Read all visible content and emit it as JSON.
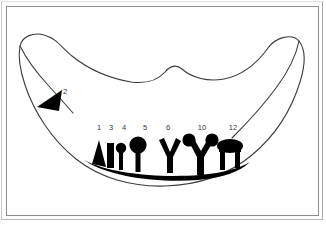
{
  "figure": {
    "background_color": "#ffffff",
    "outline_color": "#3c3c3c",
    "glyph_color": "#000000",
    "label_color": "#3a3a3a",
    "frame_color": "#8d8d8d"
  },
  "labels": {
    "pointer": {
      "text": "2",
      "x": 65,
      "y": 94
    },
    "items": [
      {
        "text": "1",
        "x": 99,
        "y": 130,
        "glyph": "triangle"
      },
      {
        "text": "3",
        "x": 110,
        "y": 130,
        "glyph": "bar"
      },
      {
        "text": "4",
        "x": 121,
        "y": 130,
        "glyph": "small-round-pin"
      },
      {
        "text": "5",
        "x": 138,
        "y": 130,
        "glyph": "large-round-pin"
      },
      {
        "text": "6",
        "x": 168,
        "y": 130,
        "glyph": "y-fork"
      },
      {
        "text": "10",
        "x": 200,
        "y": 130,
        "glyph": "y-fork-knobbed"
      },
      {
        "text": "12",
        "x": 230,
        "y": 130,
        "glyph": "mushroom-table"
      }
    ]
  },
  "shapes": {
    "outline_name": "wavy-closed-outline",
    "baseline_name": "thick-baseline-band",
    "arrow_name": "leftward-arrowhead"
  }
}
